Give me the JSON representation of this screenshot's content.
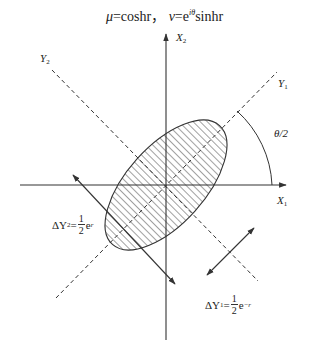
{
  "title": {
    "mu_symbol": "μ",
    "mu_expr": "=coshr",
    "separator": "，",
    "nu_symbol": "ν",
    "nu_eq": "=e",
    "nu_exp": "iθ",
    "nu_rest": "sinhr"
  },
  "axes": {
    "x1_label": "X",
    "x1_sub": "1",
    "x2_label": "X",
    "x2_sub": "2",
    "y1_label": "Y",
    "y1_sub": "1",
    "y2_label": "Y",
    "y2_sub": "2"
  },
  "angle_label": "θ/2",
  "delta_y2": {
    "prefix": "ΔY",
    "sub": "2",
    "eq": "=",
    "num": "1",
    "den": "2",
    "base": "e",
    "exp": "r"
  },
  "delta_y1": {
    "prefix": "ΔY",
    "sub": "1",
    "eq": "=",
    "num": "1",
    "den": "2",
    "base": "e",
    "exp": "−r"
  },
  "colors": {
    "stroke": "#333333",
    "hatch": "#444444",
    "background": "#ffffff"
  }
}
